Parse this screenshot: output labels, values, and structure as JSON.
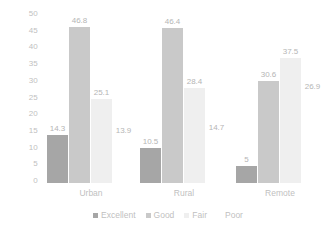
{
  "chart_data": {
    "type": "bar",
    "title": "",
    "subtitle": "",
    "xlabel": "",
    "ylabel": "",
    "categories": [
      "Urban",
      "Rural",
      "Remote"
    ],
    "series": [
      {
        "name": "Excellent",
        "color": "#a6a6a6",
        "values": [
          14.3,
          10.5,
          5
        ]
      },
      {
        "name": "Good",
        "color": "#c9c9c9",
        "values": [
          46.8,
          46.4,
          30.6
        ]
      },
      {
        "name": "Fair",
        "color": "#efefef",
        "values": [
          25.1,
          28.4,
          37.5
        ]
      },
      {
        "name": "Poor",
        "color": "#ffffff",
        "values": [
          13.9,
          14.7,
          26.9
        ]
      }
    ],
    "value_labels": [
      [
        "14.3",
        "46.8",
        "25.1",
        "13.9"
      ],
      [
        "10.5",
        "46.4",
        "28.4",
        "14.7"
      ],
      [
        "5",
        "30.6",
        "37.5",
        "26.9"
      ]
    ],
    "ylim": [
      0,
      50
    ],
    "ytick_step": 5,
    "yticks": [
      "50",
      "45",
      "40",
      "35",
      "30",
      "25",
      "20",
      "15",
      "10",
      "5",
      "0"
    ],
    "grid": false,
    "legend_position": "bottom",
    "label_color": "#bfbfbf",
    "background": "#ffffff"
  },
  "legend": {
    "items": [
      {
        "label": "Excellent",
        "color": "#a6a6a6"
      },
      {
        "label": "Good",
        "color": "#c9c9c9"
      },
      {
        "label": "Fair",
        "color": "#efefef"
      },
      {
        "label": "Poor",
        "color": "#ffffff"
      }
    ]
  }
}
